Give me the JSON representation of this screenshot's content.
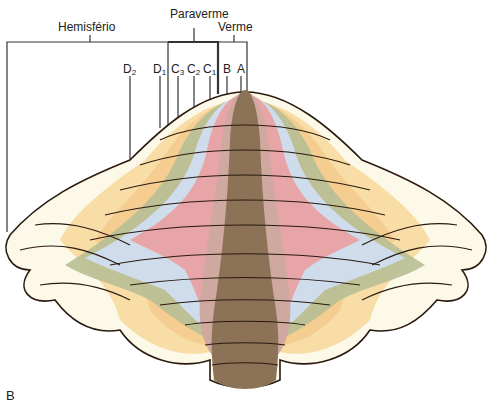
{
  "figure": {
    "panel_letter": "B",
    "brackets": {
      "hemisphere": "Hemisfério",
      "paravermis": "Paraverme",
      "vermis": "Verme"
    },
    "zones": [
      {
        "id": "D2",
        "base": "D",
        "sub": "2",
        "color": "#f7d9a0"
      },
      {
        "id": "D1",
        "base": "D",
        "sub": "1",
        "color": "#f5c98c"
      },
      {
        "id": "C3",
        "base": "C",
        "sub": "3",
        "color": "#b7bf95"
      },
      {
        "id": "C2",
        "base": "C",
        "sub": "2",
        "color": "#cfdcec"
      },
      {
        "id": "C1",
        "base": "C",
        "sub": "1",
        "color": "#e8a5a8"
      },
      {
        "id": "B",
        "base": "B",
        "sub": "",
        "color": "#cfa89f"
      },
      {
        "id": "A",
        "base": "A",
        "sub": "",
        "color": "#8c7358"
      }
    ],
    "lateral_color": "#fdf9e8",
    "outline_color": "#2a1a10"
  }
}
